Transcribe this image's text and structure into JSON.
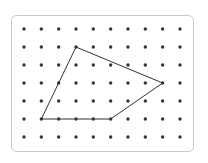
{
  "diagram": {
    "type": "geoboard-dot-grid",
    "frame": {
      "x": 11.5,
      "y": 15.5,
      "width": 182,
      "height": 136,
      "radius": 5,
      "stroke": "#c8c8c8",
      "fill": "#ffffff"
    },
    "grid": {
      "columns": 10,
      "rows": 7,
      "origin_x": 24,
      "origin_y": 29,
      "spacing_x": 17.33,
      "spacing_y": 18,
      "dot_radius": 1.7,
      "dot_color": "#333333"
    },
    "polygon": {
      "shape": "quadrilateral",
      "vertices_grid": [
        [
          3,
          1
        ],
        [
          8,
          3
        ],
        [
          5,
          5
        ],
        [
          1,
          5
        ]
      ],
      "stroke": "#333333",
      "stroke_width": 1
    }
  }
}
